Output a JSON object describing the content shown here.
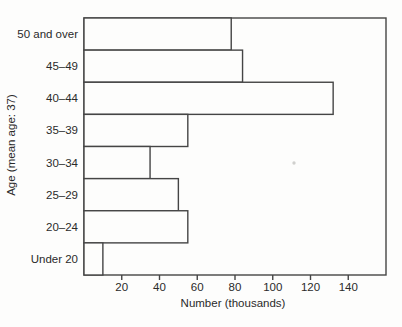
{
  "figure": {
    "background_color": "#fdfdfc",
    "line_color": "#454545",
    "text_color": "#2a2a2a",
    "bar_fill_color": "#fdfdfc"
  },
  "chart_data": {
    "type": "bar",
    "orientation": "horizontal",
    "title": "",
    "xlabel": "Number (thousands)",
    "ylabel": "Age (mean age: 37)",
    "categories": [
      "50 and over",
      "45–49",
      "40–44",
      "35–39",
      "30–34",
      "25–29",
      "20–24",
      "Under 20"
    ],
    "values": [
      78,
      84,
      132,
      55,
      35,
      50,
      55,
      10
    ],
    "xticks": [
      20,
      40,
      60,
      80,
      100,
      120,
      140
    ],
    "xlim": [
      0,
      160
    ],
    "grid": false,
    "legend": "none",
    "bar_style": "outlined-unfilled"
  }
}
